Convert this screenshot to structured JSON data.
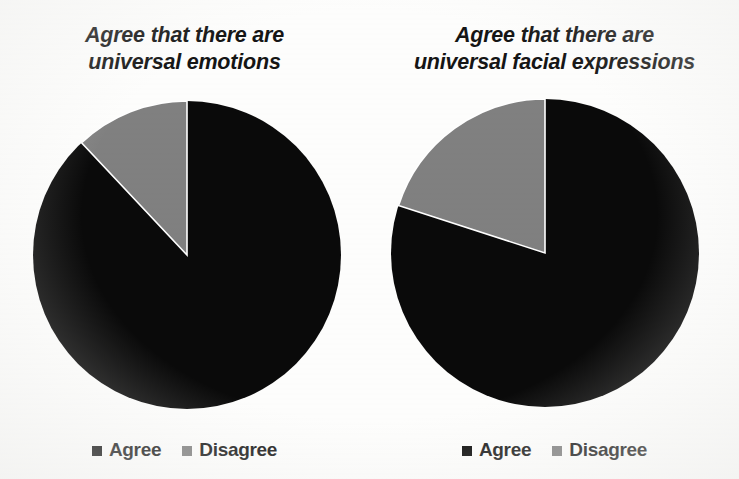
{
  "figure": {
    "background_color": "#fdfdfc",
    "width": 739,
    "height": 479
  },
  "palette": {
    "agree_color": "#0a0a0a",
    "disagree_color": "#808080",
    "text_color": "#151515"
  },
  "legend": {
    "entries": [
      {
        "label": "Agree",
        "swatch": "legend-swatch-agree",
        "color": "#0a0a0a"
      },
      {
        "label": "Disagree",
        "swatch": "legend-swatch-disagree",
        "color": "#808080"
      }
    ]
  },
  "panels": [
    {
      "title_line1": "Agree that there are",
      "title_line2": "universal emotions",
      "legend": {
        "entries": [
          {
            "label": "Agree",
            "color": "#0a0a0a"
          },
          {
            "label": "Disagree",
            "color": "#808080"
          }
        ]
      }
    },
    {
      "title_line1": "Agree that there are",
      "title_line2": "universal facial expressions",
      "legend": {
        "entries": [
          {
            "label": "Agree",
            "color": "#0a0a0a"
          },
          {
            "label": "Disagree",
            "color": "#808080"
          }
        ]
      }
    }
  ],
  "chart_data": [
    {
      "type": "pie",
      "title": "Agree that there are universal emotions",
      "labels": [
        "Agree",
        "Disagree"
      ],
      "values": [
        88,
        12
      ],
      "unit": "percent",
      "colors": [
        "#0a0a0a",
        "#808080"
      ],
      "start_angle_deg": 0,
      "direction": "counterclockwise",
      "legend_position": "bottom",
      "grid": false,
      "xlabel": "",
      "ylabel": ""
    },
    {
      "type": "pie",
      "title": "Agree that there are universal facial expressions",
      "labels": [
        "Agree",
        "Disagree"
      ],
      "values": [
        80,
        20
      ],
      "unit": "percent",
      "colors": [
        "#0a0a0a",
        "#808080"
      ],
      "start_angle_deg": 0,
      "direction": "counterclockwise",
      "legend_position": "bottom",
      "grid": false,
      "xlabel": "",
      "ylabel": ""
    }
  ]
}
